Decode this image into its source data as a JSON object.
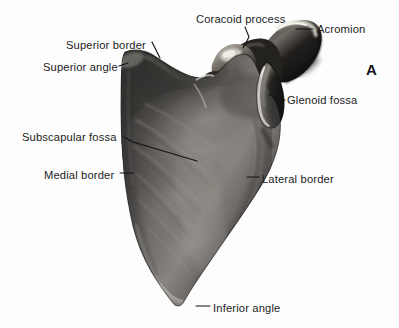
{
  "figure": {
    "letter": "A",
    "letter_position": {
      "x": 366,
      "y": 62
    },
    "specimen": "scapula",
    "view": "anterior (costal) surface",
    "background_color": "#fdfdfd",
    "leader_color": "#111111",
    "label_color": "#1c1c1c",
    "bone_tone_dark": "#22201f",
    "bone_tone_mid": "#6e6a66",
    "bone_tone_light": "#cdc9c3",
    "bone_tone_highlight": "#efece6"
  },
  "labels": [
    {
      "id": "superior-border",
      "text": "Superior border",
      "x": 66,
      "y": 40,
      "align": "left"
    },
    {
      "id": "superior-angle",
      "text": "Superior angle",
      "x": 43,
      "y": 62,
      "align": "left"
    },
    {
      "id": "coracoid-process",
      "text": "Coracoid process",
      "x": 196,
      "y": 14,
      "align": "left"
    },
    {
      "id": "acromion",
      "text": "Acromion",
      "x": 317,
      "y": 24,
      "align": "left"
    },
    {
      "id": "glenoid-fossa",
      "text": "Glenoid fossa",
      "x": 287,
      "y": 95,
      "align": "left"
    },
    {
      "id": "subscapular-fossa",
      "text": "Subscapular fossa",
      "x": 22,
      "y": 132,
      "align": "left"
    },
    {
      "id": "medial-border",
      "text": "Medial border",
      "x": 44,
      "y": 170,
      "align": "left"
    },
    {
      "id": "lateral-border",
      "text": "Lateral border",
      "x": 262,
      "y": 174,
      "align": "left"
    },
    {
      "id": "inferior-angle",
      "text": "Inferior angle",
      "x": 213,
      "y": 303,
      "align": "left"
    }
  ],
  "leaders": [
    {
      "id": "leader-superior-border",
      "points": "152,42 160,58"
    },
    {
      "id": "leader-superior-angle",
      "points": "119,66 128,63"
    },
    {
      "id": "leader-coracoid-process",
      "points": "245,27 249,37 243,48"
    },
    {
      "id": "leader-acromion",
      "points": "313,29 296,29"
    },
    {
      "id": "leader-glenoid-fossa",
      "points": "285,100 277,100 269,94"
    },
    {
      "id": "leader-subscapular-fossa",
      "points": "124,137 133,142 197,161"
    },
    {
      "id": "leader-medial-border",
      "points": "120,173 134,173"
    },
    {
      "id": "leader-lateral-border",
      "points": "259,177 247,177"
    },
    {
      "id": "leader-inferior-angle",
      "points": "210,306 196,306"
    }
  ]
}
